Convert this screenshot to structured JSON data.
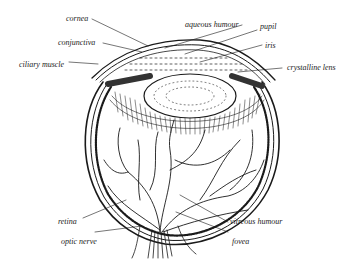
{
  "diagram": {
    "labels": {
      "cornea": "cornea",
      "conjunctiva": "conjunctiva",
      "ciliary_muscle": "ciliary muscle",
      "aqueous_humour": "aqueous humour",
      "pupil": "pupil",
      "iris": "iris",
      "crystalline_lens": "crystalline lens",
      "retina": "retina",
      "optic_nerve": "optic nerve",
      "vitreous_humour": "vitreous humour",
      "fovea": "fovea"
    },
    "colors": {
      "ink": "#1a1a1a",
      "background": "#ffffff"
    }
  }
}
